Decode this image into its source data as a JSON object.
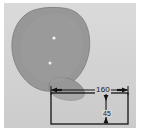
{
  "figure": {
    "type": "technical-measurement-overlay",
    "background_color": "#d2d2d2",
    "plate_border_color": "#ffffff"
  },
  "specimen": {
    "name": "specimen-outline",
    "fill_color": "#8f8f8f",
    "outline_color": "#6e6e6e",
    "description": "irregular rounded organic cross-section silhouette",
    "markers": [
      {
        "name": "marker-upper",
        "color": "#f2f2f2"
      },
      {
        "name": "marker-lower",
        "color": "#ededed"
      }
    ]
  },
  "measurement_box": {
    "name": "dimension-rectangle",
    "line_color": "#141414",
    "fill_color": "#c9c9c9"
  },
  "dimensions": {
    "width": {
      "label": "160",
      "orientation": "horizontal",
      "arrow_style": "outward-double-arrow"
    },
    "height": {
      "label": "45",
      "orientation": "vertical",
      "arrow_style": "inward-double-arrow"
    }
  }
}
